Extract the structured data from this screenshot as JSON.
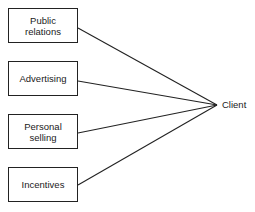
{
  "diagram": {
    "type": "convergence",
    "sources": [
      {
        "label": "Public\nrelations"
      },
      {
        "label": "Advertising"
      },
      {
        "label": "Personal\nselling"
      },
      {
        "label": "Incentives"
      }
    ],
    "target": {
      "label": "Client"
    }
  }
}
